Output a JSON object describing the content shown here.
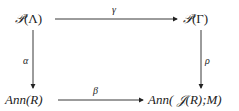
{
  "diagram": {
    "type": "commutative-square",
    "nodes": {
      "top_left": {
        "script": "𝒫",
        "arg": "(Λ)"
      },
      "top_right": {
        "script": "𝒫",
        "arg": "(Γ)"
      },
      "bottom_left": {
        "text": "Ann",
        "arg": "(R)"
      },
      "bottom_right": {
        "text": "Ann",
        "open": "( ",
        "script": "𝒥",
        "arg": "(R);M)"
      }
    },
    "arrows": {
      "top": {
        "label": "γ",
        "from": "top_left",
        "to": "top_right"
      },
      "left": {
        "label": "α",
        "from": "top_left",
        "to": "bottom_left"
      },
      "right": {
        "label": "ρ",
        "from": "top_right",
        "to": "bottom_right"
      },
      "bottom": {
        "label": "β",
        "from": "bottom_left",
        "to": "bottom_right"
      }
    }
  }
}
